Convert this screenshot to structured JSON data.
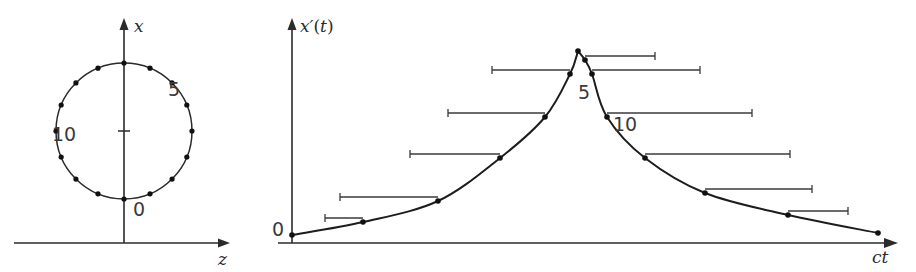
{
  "figure": {
    "width": 916,
    "height": 272,
    "background": "#ffffff",
    "ink_color": "#2b2b2b",
    "curve_color": "#1d1d1d",
    "errorbar_color": "#3a3a3a"
  },
  "left_panel": {
    "name": "rotating-clock-circle",
    "axis_x_label": "x",
    "axis_z_label": "z",
    "tick_labels": [
      "0",
      "5",
      "10"
    ],
    "tick_label_0": "0",
    "tick_label_5": "5",
    "tick_label_10": "10",
    "circle": {
      "center_x": 124,
      "center_y": 131,
      "radius": 68,
      "n_points": 16,
      "start_angle_deg": 90,
      "direction": "counterclockwise"
    },
    "point_indices": [
      0,
      1,
      2,
      3,
      4,
      5,
      6,
      7,
      8,
      9,
      10,
      11,
      12,
      13,
      14,
      15
    ],
    "label_positions": {
      "zero": {
        "x": 133,
        "y": 216
      },
      "five": {
        "x": 168,
        "y": 96
      },
      "ten": {
        "x": 52,
        "y": 141
      }
    },
    "x_axis": {
      "x": 124,
      "y_top": 18,
      "y_bottom": 243
    },
    "z_axis": {
      "y": 243,
      "x_left": 14,
      "x_right": 230
    },
    "center_tick": {
      "x": 124,
      "y": 131,
      "half_width": 6
    }
  },
  "right_panel": {
    "name": "doppler-signal-plot",
    "axis_y_label_italic": "x",
    "axis_y_label_prime": "′",
    "axis_y_label_paren_open": "(",
    "axis_y_label_t": "t",
    "axis_y_label_paren_close": ")",
    "axis_x_label_c": "c",
    "axis_x_label_t": "t",
    "origin_label": "0",
    "annotation_5": "5",
    "annotation_10": "10",
    "y_axis": {
      "x": 292,
      "y_top": 18,
      "y_bottom": 243
    },
    "x_axis": {
      "y": 243,
      "x_left": 278,
      "x_right": 898
    },
    "label_positions": {
      "origin": {
        "x": 272,
        "y": 236
      },
      "five": {
        "x": 578,
        "y": 99
      },
      "ten": {
        "x": 613,
        "y": 131
      },
      "y_axis_label": {
        "x": 300,
        "y": 22
      },
      "x_axis_label": {
        "x": 872,
        "y": 263
      }
    }
  },
  "chart_data": {
    "type": "line",
    "title": "",
    "xlabel": "ct",
    "ylabel": "x'(t)",
    "grid": false,
    "legend": null,
    "axis_arrows": true,
    "ylim": [
      0,
      1
    ],
    "xlim": [
      0,
      1
    ],
    "series": [
      {
        "name": "x'(t)",
        "points": [
          {
            "index": 0,
            "x": 292,
            "y": 235,
            "bar_from": null,
            "bar_to": null
          },
          {
            "index": 1,
            "x": 363,
            "y": 222,
            "bar_from": 325,
            "bar_to": 363
          },
          {
            "index": 2,
            "x": 438,
            "y": 201,
            "bar_from": 340,
            "bar_to": 438
          },
          {
            "index": 3,
            "x": 500,
            "y": 158,
            "bar_from": 410,
            "bar_to": 500
          },
          {
            "index": 4,
            "x": 545,
            "y": 117,
            "bar_from": 448,
            "bar_to": 545
          },
          {
            "index": 5,
            "x": 570,
            "y": 74,
            "bar_from": 492,
            "bar_to": 570
          },
          {
            "index": 6,
            "x": 578,
            "y": 51,
            "bar_from": null,
            "bar_to": null
          },
          {
            "index": 7,
            "x": 585,
            "y": 60,
            "bar_from": 585,
            "bar_to": 655
          },
          {
            "index": 8,
            "x": 592,
            "y": 74,
            "bar_from": 592,
            "bar_to": 700
          },
          {
            "index": 9,
            "x": 607,
            "y": 117,
            "bar_from": 607,
            "bar_to": 752
          },
          {
            "index": 10,
            "x": 645,
            "y": 158,
            "bar_from": 645,
            "bar_to": 790
          },
          {
            "index": 11,
            "x": 705,
            "y": 193,
            "bar_from": 705,
            "bar_to": 812
          },
          {
            "index": 12,
            "x": 788,
            "y": 215,
            "bar_from": 788,
            "bar_to": 848
          },
          {
            "index": 13,
            "x": 878,
            "y": 233,
            "bar_from": null,
            "bar_to": null
          }
        ]
      }
    ]
  }
}
